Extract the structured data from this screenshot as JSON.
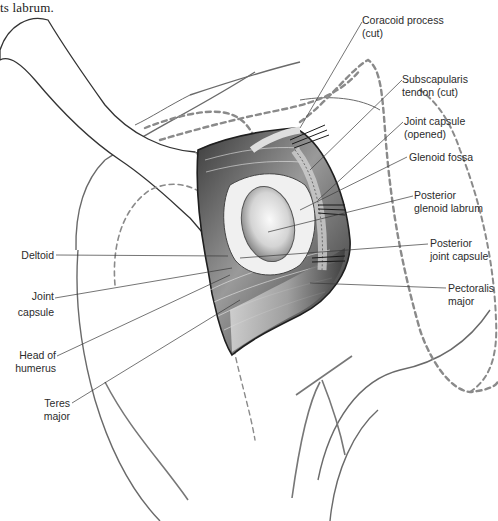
{
  "caption_fragment": "ts labrum.",
  "figure": {
    "colors": {
      "line": "#3a3a3a",
      "dashed_outline": "#8a8a8a",
      "tissue_dark": "#2a2a2a",
      "tissue_mid": "#8c8c8c",
      "tissue_light": "#e6e6e6",
      "background": "#ffffff"
    }
  },
  "labels_right": [
    {
      "id": "coracoid",
      "line1": "Coracoid process",
      "line2": "(cut)"
    },
    {
      "id": "subscap",
      "line1": "Subscapularis",
      "line2": "tendon (cut)"
    },
    {
      "id": "capsule-opened",
      "line1": "Joint capsule",
      "line2": "(opened)"
    },
    {
      "id": "glenoid-fossa",
      "line1": "Glenoid fossa",
      "line2": ""
    },
    {
      "id": "post-labrum",
      "line1": "Posterior",
      "line2": "glenoid labrum"
    },
    {
      "id": "post-capsule",
      "line1": "Posterior",
      "line2": "joint capsule"
    },
    {
      "id": "pec-major",
      "line1": "Pectoralis",
      "line2": "major"
    }
  ],
  "labels_left": [
    {
      "id": "deltoid",
      "line1": "Deltoid",
      "line2": ""
    },
    {
      "id": "joint-capsule",
      "line1": "Joint",
      "line2": "capsule"
    },
    {
      "id": "head-humerus",
      "line1": "Head of",
      "line2": "humerus"
    },
    {
      "id": "teres-major",
      "line1": "Teres",
      "line2": "major"
    }
  ]
}
